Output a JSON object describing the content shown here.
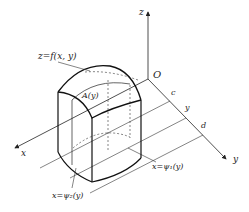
{
  "figure": {
    "type": "3d-coordinate-diagram",
    "colors": {
      "line": "#222222",
      "background": "#ffffff"
    }
  },
  "axes": {
    "z_label": "z",
    "y_label": "y",
    "x_label": "x",
    "origin_label": "O"
  },
  "y_ticks": {
    "c": "c",
    "y": "y",
    "d": "d"
  },
  "annotations": {
    "surface": "z=f(x, y)",
    "cross_section": "A(y)",
    "boundary_left": "x=ψ₂(y)",
    "boundary_right": "x=ψ₁(y)"
  }
}
